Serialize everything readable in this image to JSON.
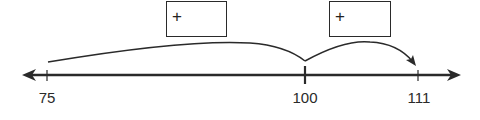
{
  "diagram": {
    "type": "open-number-line",
    "line_color": "#2a2a2a",
    "ticks": [
      {
        "value": "75",
        "x": 47
      },
      {
        "value": "100",
        "x": 305
      },
      {
        "value": "111",
        "x": 418
      }
    ],
    "jumps": [
      {
        "from": "75",
        "to": "100",
        "box": {
          "sign": "+",
          "value": ""
        }
      },
      {
        "from": "100",
        "to": "111",
        "box": {
          "sign": "+",
          "value": ""
        }
      }
    ]
  }
}
